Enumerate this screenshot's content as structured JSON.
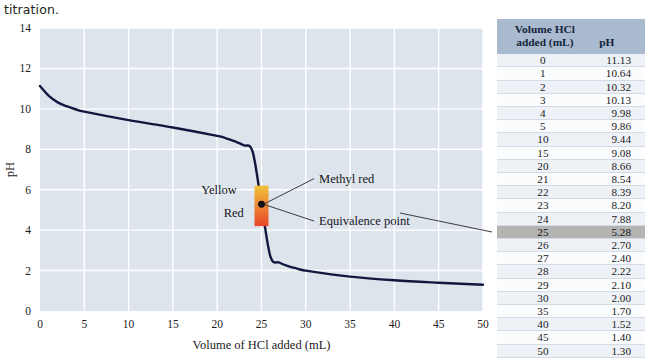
{
  "caption": "titration.",
  "chart_data": {
    "type": "line",
    "title": "",
    "xlabel": "Volume of HCl added (mL)",
    "ylabel": "pH",
    "xlim": [
      0,
      50
    ],
    "ylim": [
      0,
      14
    ],
    "xticks": [
      0,
      5,
      10,
      15,
      20,
      25,
      30,
      35,
      40,
      45,
      50
    ],
    "yticks": [
      0,
      2,
      4,
      6,
      8,
      10,
      12,
      14
    ],
    "grid": true,
    "legend": "none",
    "series": [
      {
        "name": "pH titration curve",
        "color": "#13173f",
        "x": [
          0,
          1,
          2,
          3,
          4,
          5,
          10,
          15,
          20,
          21,
          22,
          23,
          24,
          25,
          26,
          27,
          28,
          29,
          30,
          35,
          40,
          45,
          50
        ],
        "y": [
          11.13,
          10.64,
          10.32,
          10.13,
          9.98,
          9.86,
          9.44,
          9.08,
          8.66,
          8.54,
          8.39,
          8.2,
          7.88,
          5.28,
          2.7,
          2.4,
          2.22,
          2.1,
          2.0,
          1.7,
          1.52,
          1.4,
          1.3
        ]
      }
    ],
    "annotations": [
      {
        "name": "methyl-red",
        "label": "Methyl red",
        "x": 31.5,
        "y": 6.55
      },
      {
        "name": "equivalence-point",
        "label": "Equivalence point",
        "x": 31.5,
        "y": 4.45
      },
      {
        "name": "indicator-yellow",
        "label": "Yellow",
        "x": 22.2,
        "y": 6.0
      },
      {
        "name": "indicator-red",
        "label": "Red",
        "x": 23.0,
        "y": 4.85
      }
    ],
    "indicator_band": {
      "name": "methyl-red-band",
      "x": 25.0,
      "y_low": 4.2,
      "y_high": 6.2,
      "color_top": "#f2c23a",
      "color_bottom": "#e8462a"
    },
    "equivalence_point": {
      "x": 25.0,
      "y": 5.28
    }
  },
  "table": {
    "headers": {
      "volume_line1": "Volume HCl",
      "volume_line2": "added (mL)",
      "ph": "pH"
    },
    "highlight_row_index": 13,
    "rows": [
      {
        "volume": "0",
        "ph": "11.13"
      },
      {
        "volume": "1",
        "ph": "10.64"
      },
      {
        "volume": "2",
        "ph": "10.32"
      },
      {
        "volume": "3",
        "ph": "10.13"
      },
      {
        "volume": "4",
        "ph": "9.98"
      },
      {
        "volume": "5",
        "ph": "9.86"
      },
      {
        "volume": "10",
        "ph": "9.44"
      },
      {
        "volume": "15",
        "ph": "9.08"
      },
      {
        "volume": "20",
        "ph": "8.66"
      },
      {
        "volume": "21",
        "ph": "8.54"
      },
      {
        "volume": "22",
        "ph": "8.39"
      },
      {
        "volume": "23",
        "ph": "8.20"
      },
      {
        "volume": "24",
        "ph": "7.88"
      },
      {
        "volume": "25",
        "ph": "5.28"
      },
      {
        "volume": "26",
        "ph": "2.70"
      },
      {
        "volume": "27",
        "ph": "2.40"
      },
      {
        "volume": "28",
        "ph": "2.22"
      },
      {
        "volume": "29",
        "ph": "2.10"
      },
      {
        "volume": "30",
        "ph": "2.00"
      },
      {
        "volume": "35",
        "ph": "1.70"
      },
      {
        "volume": "40",
        "ph": "1.52"
      },
      {
        "volume": "45",
        "ph": "1.40"
      },
      {
        "volume": "50",
        "ph": "1.30"
      }
    ]
  },
  "colors": {
    "plot_background": "#dde4ec",
    "grid": "#ffffff",
    "curve": "#13173f",
    "table_header": "#a9bace",
    "highlight": "#b4b4b2"
  }
}
